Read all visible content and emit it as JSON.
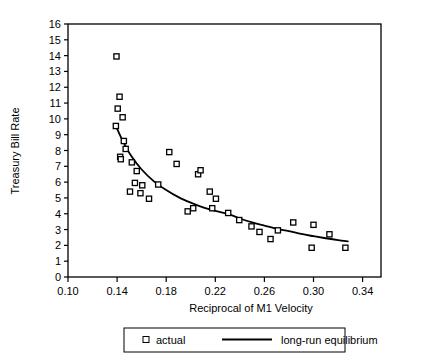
{
  "chart_data": {
    "type": "scatter",
    "title": "",
    "xlabel": "Reciprocal of M1 Velocity",
    "ylabel": "Treasury Bill Rate",
    "xlim": [
      0.1,
      0.355
    ],
    "ylim": [
      0,
      16
    ],
    "xticks": [
      "0.10",
      "0.14",
      "0.18",
      "0.22",
      "0.26",
      "0.30",
      "0.34"
    ],
    "xtick_values": [
      0.1,
      0.14,
      0.18,
      0.22,
      0.26,
      0.3,
      0.34
    ],
    "yticks": [
      "0",
      "1",
      "2",
      "3",
      "4",
      "5",
      "6",
      "7",
      "8",
      "9",
      "10",
      "11",
      "12",
      "13",
      "14",
      "15",
      "16"
    ],
    "ytick_values": [
      0,
      1,
      2,
      3,
      4,
      5,
      6,
      7,
      8,
      9,
      10,
      11,
      12,
      13,
      14,
      15,
      16
    ],
    "grid": false,
    "legend_position": "bottom",
    "series": [
      {
        "name": "actual",
        "type": "scatter",
        "marker": "open-square",
        "color": "#000000",
        "points": [
          [
            0.1395,
            13.95
          ],
          [
            0.142,
            11.4
          ],
          [
            0.1405,
            10.65
          ],
          [
            0.1445,
            10.1
          ],
          [
            0.139,
            9.55
          ],
          [
            0.1455,
            8.6
          ],
          [
            0.147,
            8.1
          ],
          [
            0.1425,
            7.6
          ],
          [
            0.143,
            7.45
          ],
          [
            0.152,
            7.25
          ],
          [
            0.156,
            6.7
          ],
          [
            0.1545,
            5.95
          ],
          [
            0.1605,
            5.8
          ],
          [
            0.1505,
            5.4
          ],
          [
            0.159,
            5.3
          ],
          [
            0.166,
            4.95
          ],
          [
            0.1735,
            5.85
          ],
          [
            0.1825,
            7.9
          ],
          [
            0.1885,
            7.15
          ],
          [
            0.206,
            6.5
          ],
          [
            0.208,
            6.75
          ],
          [
            0.1975,
            4.15
          ],
          [
            0.202,
            4.35
          ],
          [
            0.2155,
            5.4
          ],
          [
            0.2205,
            4.95
          ],
          [
            0.2175,
            4.35
          ],
          [
            0.2305,
            4.05
          ],
          [
            0.2395,
            3.6
          ],
          [
            0.2495,
            3.2
          ],
          [
            0.256,
            2.85
          ],
          [
            0.265,
            2.4
          ],
          [
            0.271,
            2.95
          ],
          [
            0.2835,
            3.45
          ],
          [
            0.2985,
            1.85
          ],
          [
            0.3,
            3.3
          ],
          [
            0.313,
            2.7
          ],
          [
            0.326,
            1.85
          ]
        ]
      },
      {
        "name": "long-run equilibrium",
        "type": "line",
        "color": "#000000",
        "points": [
          [
            0.139,
            9.55
          ],
          [
            0.145,
            8.55
          ],
          [
            0.152,
            7.6
          ],
          [
            0.16,
            6.8
          ],
          [
            0.17,
            6.05
          ],
          [
            0.18,
            5.5
          ],
          [
            0.19,
            5.05
          ],
          [
            0.2,
            4.7
          ],
          [
            0.21,
            4.4
          ],
          [
            0.22,
            4.18
          ],
          [
            0.23,
            4.0
          ],
          [
            0.24,
            3.7
          ],
          [
            0.25,
            3.45
          ],
          [
            0.26,
            3.25
          ],
          [
            0.27,
            3.05
          ],
          [
            0.28,
            2.9
          ],
          [
            0.29,
            2.72
          ],
          [
            0.3,
            2.58
          ],
          [
            0.31,
            2.45
          ],
          [
            0.32,
            2.33
          ],
          [
            0.328,
            2.25
          ]
        ]
      }
    ],
    "legend": [
      {
        "label": "actual",
        "marker": "open-square"
      },
      {
        "label": "long-run equilibrium",
        "marker": "line"
      }
    ]
  },
  "axes": {
    "ylabel": "Treasury Bill Rate",
    "xlabel": "Reciprocal of M1 Velocity"
  },
  "legend": {
    "actual_label": "actual",
    "equilibrium_label": "long-run equilibrium"
  },
  "colors": {
    "ink": "#000000",
    "background": "#ffffff"
  }
}
